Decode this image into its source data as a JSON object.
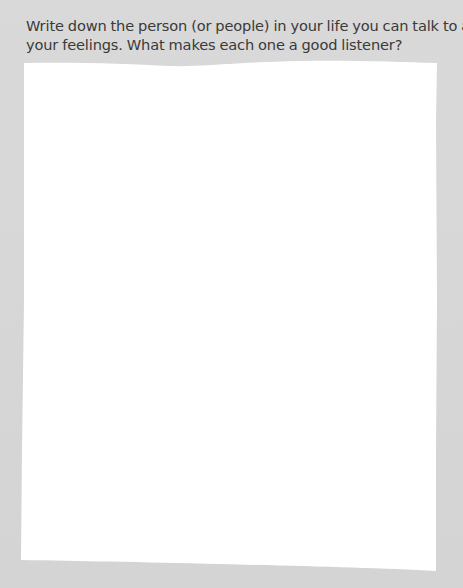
{
  "prompt": {
    "line1": "Write down the person (or people) in your life you can talk to about",
    "line2": "your feelings. What makes each one a good listener?"
  },
  "answer_area": {
    "value": "",
    "placeholder": ""
  },
  "colors": {
    "background": "#d5d5d5",
    "paper": "#ffffff",
    "text": "#3a3a3a"
  }
}
